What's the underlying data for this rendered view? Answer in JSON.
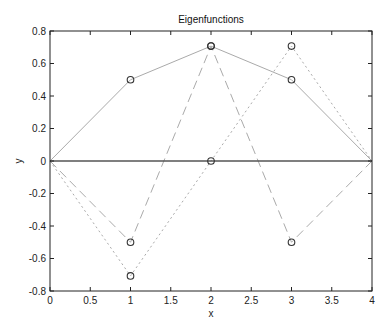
{
  "chart_data": {
    "type": "line",
    "title": "Eigenfunctions",
    "xlabel": "x",
    "ylabel": "y",
    "xlim": [
      0,
      4
    ],
    "ylim": [
      -0.8,
      0.8
    ],
    "grid": false,
    "legend": null,
    "x_ticks": [
      0,
      0.5,
      1,
      1.5,
      2,
      2.5,
      3,
      3.5,
      4
    ],
    "x_tick_labels": [
      "0",
      "0.5",
      "1",
      "1.5",
      "2",
      "2.5",
      "3",
      "3.5",
      "4"
    ],
    "y_ticks": [
      -0.8,
      -0.6,
      -0.4,
      -0.2,
      0,
      0.2,
      0.4,
      0.6,
      0.8
    ],
    "y_tick_labels": [
      "-0.8",
      "-0.6",
      "-0.4",
      "-0.2",
      "0",
      "0.2",
      "0.4",
      "0.6",
      "0.8"
    ],
    "x": [
      0,
      1,
      2,
      3,
      4
    ],
    "series": [
      {
        "name": "eigenfunction-1",
        "style": "solid",
        "color": "#aaaaaa",
        "marker": "circle",
        "values": [
          0,
          0.5,
          0.707,
          0.5,
          0
        ]
      },
      {
        "name": "eigenfunction-2",
        "style": "dashed",
        "color": "#aaaaaa",
        "marker": "circle",
        "values": [
          0,
          -0.5,
          0.707,
          -0.5,
          0
        ]
      },
      {
        "name": "eigenfunction-3",
        "style": "dotted",
        "color": "#aaaaaa",
        "marker": "circle",
        "values": [
          0,
          -0.707,
          0,
          0.707,
          0
        ]
      },
      {
        "name": "zero-line",
        "style": "solid",
        "color": "#555555",
        "marker": "none",
        "values": [
          0,
          0,
          0,
          0,
          0
        ]
      }
    ]
  }
}
